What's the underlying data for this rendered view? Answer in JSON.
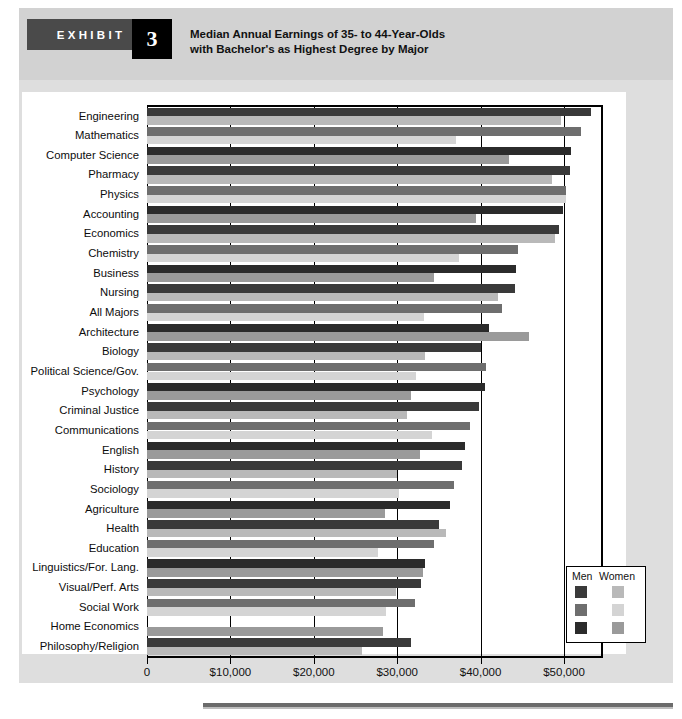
{
  "exhibit": {
    "tag_label": "EXHIBIT",
    "number": "3",
    "title_line1": "Median Annual Earnings of 35- to 44-Year-Olds",
    "title_line2": "with Bachelor's as Highest Degree by Major"
  },
  "legend": {
    "men_label": "Men",
    "women_label": "Women",
    "men_colors": [
      "#3a3a3a",
      "#6e6e6e",
      "#2b2b2b"
    ],
    "women_colors": [
      "#b9b9b9",
      "#d4d4d4",
      "#9a9a9a"
    ]
  },
  "axis": {
    "tick_labels": [
      "0",
      "$10,000",
      "$20,000",
      "$30,000",
      "$40,000",
      "$50,000"
    ],
    "tick_values": [
      0,
      10000,
      20000,
      30000,
      40000,
      50000
    ]
  },
  "chart_data": {
    "type": "bar",
    "orientation": "horizontal",
    "title": "Median Annual Earnings of 35- to 44-Year-Olds with Bachelor's as Highest Degree by Major",
    "xlabel": "",
    "ylabel": "",
    "xlim": [
      0,
      54500
    ],
    "grid": true,
    "legend_position": "bottom-right",
    "categories": [
      "Engineering",
      "Mathematics",
      "Computer Science",
      "Pharmacy",
      "Physics",
      "Accounting",
      "Economics",
      "Chemistry",
      "Business",
      "Nursing",
      "All Majors",
      "Architecture",
      "Biology",
      "Political Science/Gov.",
      "Psychology",
      "Criminal Justice",
      "Communications",
      "English",
      "History",
      "Sociology",
      "Agriculture",
      "Health",
      "Education",
      "Linguistics/For. Lang.",
      "Visual/Perf. Arts",
      "Social Work",
      "Home Economics",
      "Philosophy/Religion"
    ],
    "series": [
      {
        "name": "Men",
        "values": [
          53200,
          52000,
          50800,
          50700,
          50200,
          49900,
          49400,
          44500,
          44200,
          44100,
          42600,
          41000,
          40000,
          40600,
          40500,
          39800,
          38700,
          38100,
          37800,
          36800,
          36300,
          35000,
          34400,
          33300,
          32800,
          32100,
          0,
          31600
        ]
      },
      {
        "name": "Women",
        "values": [
          49700,
          37000,
          43400,
          48600,
          50200,
          39500,
          48900,
          37400,
          34400,
          42100,
          33200,
          45800,
          33300,
          32300,
          31700,
          31200,
          34200,
          32700,
          30000,
          30200,
          28500,
          35900,
          27700,
          33100,
          29900,
          28700,
          28300,
          25800
        ]
      }
    ]
  }
}
